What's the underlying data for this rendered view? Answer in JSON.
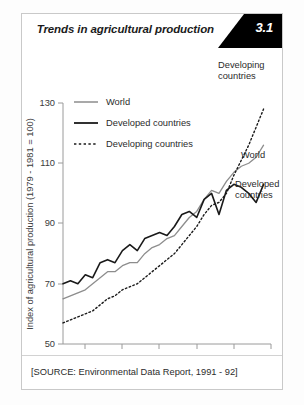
{
  "header": {
    "title": "Trends in agricultural production",
    "number": "3.1"
  },
  "footer": {
    "source": "[SOURCE: Environmental Data Report, 1991 - 92]"
  },
  "legend": {
    "items": [
      {
        "label": "World",
        "style": "solid-gray",
        "color": "#8d8d8d"
      },
      {
        "label": "Developed countries",
        "style": "solid-black",
        "color": "#1a1a1a"
      },
      {
        "label": "Developing countries",
        "style": "dotted-black",
        "color": "#1a1a1a"
      }
    ]
  },
  "annotations": [
    {
      "name": "developing-countries-label",
      "lines": [
        "Developing",
        "countries"
      ]
    },
    {
      "name": "world-label",
      "lines": [
        "World"
      ]
    },
    {
      "name": "developed-countries-label",
      "lines": [
        "Developed",
        "countries"
      ]
    }
  ],
  "chart_data": {
    "type": "line",
    "title": "Trends in agricultural production",
    "xlabel": "Year",
    "ylabel": "Index of agricultural production (1979 - 1981 = 100)",
    "xlim": [
      1962,
      1990
    ],
    "ylim": [
      50,
      130
    ],
    "grid": false,
    "legend_position": "top-left-inside",
    "xticks": [
      1965,
      1970,
      1975,
      1980,
      1985,
      1990
    ],
    "yticks": [
      50,
      70,
      90,
      110,
      130
    ],
    "x": [
      1962,
      1963,
      1964,
      1965,
      1966,
      1967,
      1968,
      1969,
      1970,
      1971,
      1972,
      1973,
      1974,
      1975,
      1976,
      1977,
      1978,
      1979,
      1980,
      1981,
      1982,
      1983,
      1984,
      1985,
      1986,
      1987,
      1988,
      1989
    ],
    "series": [
      {
        "name": "World",
        "color": "#8d8d8d",
        "dash": "none",
        "width": 1.3,
        "values": [
          65,
          66,
          67,
          68,
          70,
          72,
          74,
          74,
          76,
          77,
          77,
          80,
          82,
          83,
          85,
          86,
          89,
          92,
          94,
          98,
          101,
          100,
          104,
          107,
          109,
          110,
          112,
          116
        ]
      },
      {
        "name": "Developed countries",
        "color": "#1a1a1a",
        "dash": "none",
        "width": 1.6,
        "values": [
          70,
          71,
          70,
          73,
          72,
          77,
          78,
          77,
          81,
          83,
          81,
          85,
          86,
          87,
          86,
          89,
          93,
          94,
          92,
          98,
          100,
          93,
          101,
          103,
          102,
          100,
          97,
          103
        ]
      },
      {
        "name": "Developing countries",
        "color": "#1a1a1a",
        "dash": "dotted",
        "width": 1.4,
        "values": [
          57,
          58,
          59,
          60,
          61,
          63,
          65,
          66,
          68,
          69,
          70,
          72,
          74,
          76,
          78,
          80,
          83,
          86,
          89,
          93,
          96,
          97,
          100,
          106,
          111,
          116,
          122,
          128
        ]
      }
    ]
  }
}
